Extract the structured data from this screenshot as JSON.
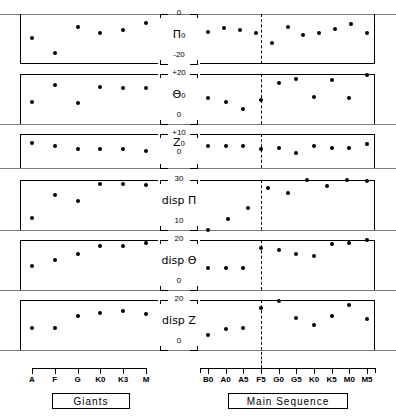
{
  "figure": {
    "divider_label": "F5",
    "groups": [
      {
        "name": "giants",
        "box_label": "Giants",
        "ticks": [
          "A",
          "F",
          "G",
          "K0",
          "K3",
          "M"
        ]
      },
      {
        "name": "main-sequence",
        "box_label": "Main Sequence",
        "ticks": [
          "B0",
          "A0",
          "A5",
          "F5",
          "G0",
          "G5",
          "K0",
          "K5",
          "M0",
          "M5"
        ]
      }
    ],
    "caption": ""
  },
  "chart_data": {
    "type": "scatter",
    "xlabel": "Spectral type",
    "grid": false,
    "legend": "none",
    "divider": {
      "x_label": "F5",
      "style": "dashed",
      "applies_to": "main-sequence"
    },
    "x_categories": {
      "giants": [
        "A",
        "F",
        "G",
        "K0",
        "K3",
        "M"
      ],
      "main_sequence": [
        "B0",
        "A0",
        "A5",
        "F5",
        "G0",
        "G5",
        "K0",
        "K5",
        "M0",
        "M5"
      ]
    },
    "panels": [
      {
        "id": "pi0",
        "ylabel": "Π₀",
        "ylabel_top": "0",
        "ylabel_bottom": "-20",
        "ylim": [
          -20,
          0
        ],
        "series": [
          {
            "name": "Giants",
            "x": [
              "A",
              "F",
              "G",
              "K0",
              "K3",
              "M"
            ],
            "values": [
              -9.5,
              -15.5,
              -5.0,
              -7.5,
              -6.5,
              -3.5
            ]
          },
          {
            "name": "Main Sequence",
            "x": [
              "B0",
              "A0",
              "A5",
              "F5",
              "G0",
              "G5",
              "K0",
              "K5",
              "M0",
              "M5"
            ],
            "values": [
              -7.0,
              -5.5,
              -6.5,
              -7.5,
              -11.5,
              -5.0,
              -8.5,
              -7.5,
              -6.0,
              -4.0,
              -7.5
            ]
          }
        ]
      },
      {
        "id": "theta0",
        "ylabel": "Θ₀",
        "ylabel_top": "+20",
        "ylabel_bottom": "0",
        "ylim": [
          0,
          20
        ],
        "series": [
          {
            "name": "Giants",
            "x": [
              "A",
              "F",
              "G",
              "K0",
              "K3",
              "M"
            ],
            "values": [
              9.0,
              15.5,
              8.5,
              15.0,
              14.5,
              14.5
            ]
          },
          {
            "name": "Main Sequence",
            "x": [
              "B0",
              "A0",
              "A5",
              "F5",
              "G0",
              "G5",
              "K0",
              "K5",
              "M0",
              "M5"
            ],
            "values": [
              10.5,
              9.0,
              6.0,
              9.5,
              16.5,
              18.0,
              11.0,
              17.5,
              10.5,
              19.5
            ]
          }
        ]
      },
      {
        "id": "z0",
        "ylabel": "Z₀",
        "ylabel_top": "+10",
        "ylabel_bottom": "0",
        "ylim": [
          0,
          10
        ],
        "series": [
          {
            "name": "Giants",
            "x": [
              "A",
              "F",
              "G",
              "K0",
              "K3",
              "M"
            ],
            "values": [
              7.5,
              6.5,
              5.5,
              5.5,
              5.5,
              5.0
            ]
          },
          {
            "name": "Main Sequence",
            "x": [
              "B0",
              "A0",
              "A5",
              "F5",
              "G0",
              "G5",
              "K0",
              "K5",
              "M0",
              "M5"
            ],
            "values": [
              6.5,
              6.5,
              6.5,
              5.5,
              6.0,
              4.5,
              6.5,
              6.0,
              6.0,
              7.0
            ]
          }
        ]
      },
      {
        "id": "disp-pi",
        "ylabel": "disp Π",
        "ylabel_top": "30",
        "ylabel_bottom": "10",
        "ylim": [
          10,
          30
        ],
        "series": [
          {
            "name": "Giants",
            "x": [
              "A",
              "F",
              "G",
              "K0",
              "K3",
              "M"
            ],
            "values": [
              15.0,
              24.0,
              21.5,
              28.5,
              28.5,
              28.0
            ]
          },
          {
            "name": "Main Sequence",
            "x": [
              "B0",
              "A0",
              "A5",
              "F5",
              "G0",
              "G5",
              "K0",
              "K5",
              "M0",
              "M5"
            ],
            "values": [
              10.0,
              14.5,
              19.0,
              27.0,
              25.0,
              30.0,
              27.5,
              30.0,
              29.5
            ]
          }
        ]
      },
      {
        "id": "disp-theta",
        "ylabel": "disp Θ",
        "ylabel_top": "20",
        "ylabel_bottom": "0",
        "ylim": [
          0,
          20
        ],
        "series": [
          {
            "name": "Giants",
            "x": [
              "A",
              "F",
              "G",
              "K0",
              "K3",
              "M"
            ],
            "values": [
              9.5,
              12.0,
              14.5,
              17.5,
              17.5,
              19.0
            ]
          },
          {
            "name": "Main Sequence",
            "x": [
              "B0",
              "A0",
              "A5",
              "F5",
              "G0",
              "G5",
              "K0",
              "K5",
              "M0",
              "M5"
            ],
            "values": [
              9.0,
              9.0,
              9.0,
              17.0,
              16.0,
              14.5,
              13.5,
              18.5,
              19.0,
              20.0
            ]
          }
        ]
      },
      {
        "id": "disp-z",
        "ylabel": "disp Z",
        "ylabel_top": "20",
        "ylabel_bottom": "0",
        "ylim": [
          0,
          20
        ],
        "series": [
          {
            "name": "Giants",
            "x": [
              "A",
              "F",
              "G",
              "K0",
              "K3",
              "M"
            ],
            "values": [
              9.0,
              9.0,
              13.5,
              15.0,
              15.5,
              14.5
            ]
          },
          {
            "name": "Main Sequence",
            "x": [
              "B0",
              "A0",
              "A5",
              "F5",
              "G0",
              "G5",
              "K0",
              "K5",
              "M0",
              "M5"
            ],
            "values": [
              6.0,
              8.5,
              9.0,
              17.0,
              19.5,
              13.0,
              10.0,
              13.5,
              18.0,
              12.5
            ]
          }
        ]
      }
    ]
  }
}
